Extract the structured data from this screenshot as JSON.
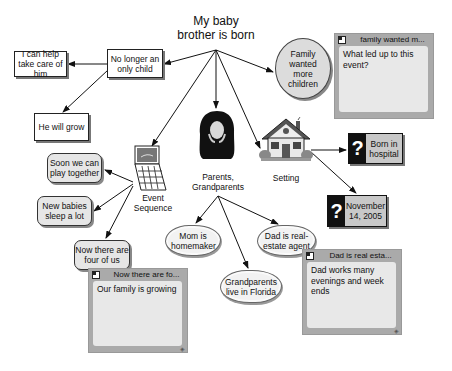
{
  "diagram": {
    "root": {
      "label": "My baby brother is born"
    },
    "nodes": {
      "help_care": "I can help take care of him",
      "only_child": "No longer an only child",
      "will_grow": "He will grow",
      "wanted_more": "Family wanted more children",
      "play_together": "Soon we can play together",
      "babies_sleep": "New babies sleep a lot",
      "four_of_us": "Now there are four of us",
      "event_sequence": "Event Sequence",
      "parents": "Parents, Grandparents",
      "setting": "Setting",
      "born_hospital": "Born in hospital",
      "date": "November 14, 2005",
      "mom": "Mom is homemaker",
      "dad": "Dad is real-estate agent",
      "grandparents": "Grandparents live in Florida"
    },
    "question_mark": "?",
    "notes": [
      {
        "title": "family wanted m...",
        "body": "What led up to this event?"
      },
      {
        "title": "Now there are fo...",
        "body": "Our family is growing"
      },
      {
        "title": "Dad is real esta...",
        "body": "Dad works many evenings and week ends"
      }
    ],
    "grip_glyph": "◈"
  }
}
